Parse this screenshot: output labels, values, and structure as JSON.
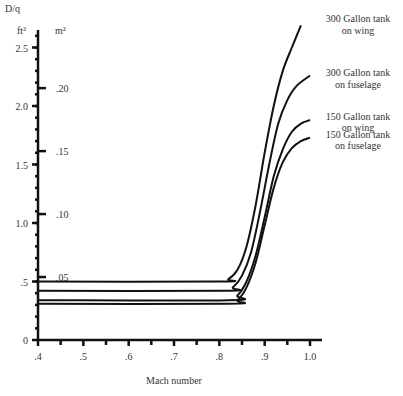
{
  "chart_data": {
    "type": "line",
    "title": "",
    "ylabel": "D/q",
    "ylabel_units_primary": "ft²",
    "ylabel_units_secondary": "m²",
    "xlabel": "Mach number",
    "xlim": [
      0.4,
      1.0
    ],
    "ylim": [
      0,
      2.7
    ],
    "x_ticks": [
      ".4",
      ".5",
      ".6",
      ".7",
      ".8",
      ".9",
      "1.0"
    ],
    "x_tick_values": [
      0.4,
      0.5,
      0.6,
      0.7,
      0.8,
      0.9,
      1.0
    ],
    "y_ticks_ft2": [
      "0",
      ".5",
      "1.0",
      "1.5",
      "2.0",
      "2.5"
    ],
    "y_tick_values_ft2": [
      0,
      0.5,
      1.0,
      1.5,
      2.0,
      2.5
    ],
    "y_ticks_m2": [
      ".05",
      ".10",
      ".15",
      ".20"
    ],
    "y_tick_values_m2": [
      0.05,
      0.1,
      0.15,
      0.2
    ],
    "grid": false,
    "legend_position": "inline-right",
    "series": [
      {
        "name": "300 Gallon tank on wing",
        "label_lines": [
          "300 Gallon tank",
          "on wing"
        ],
        "x": [
          0.4,
          0.8,
          0.82,
          0.84,
          0.86,
          0.88,
          0.9,
          0.92,
          0.94,
          0.96,
          0.98
        ],
        "values": [
          0.5,
          0.5,
          0.52,
          0.6,
          0.8,
          1.15,
          1.6,
          2.0,
          2.3,
          2.5,
          2.69
        ]
      },
      {
        "name": "300 Gallon tank on fuselage",
        "label_lines": [
          "300 Gallon tank",
          "on fuselage"
        ],
        "x": [
          0.4,
          0.81,
          0.83,
          0.85,
          0.87,
          0.89,
          0.91,
          0.93,
          0.95,
          0.97,
          1.0
        ],
        "values": [
          0.42,
          0.42,
          0.45,
          0.55,
          0.75,
          1.1,
          1.5,
          1.85,
          2.05,
          2.17,
          2.26
        ]
      },
      {
        "name": "150 Gallon tank on wing",
        "label_lines": [
          "150 Gallon tank",
          "on wing"
        ],
        "x": [
          0.4,
          0.82,
          0.84,
          0.86,
          0.88,
          0.9,
          0.92,
          0.94,
          0.96,
          0.98,
          1.0
        ],
        "values": [
          0.34,
          0.34,
          0.38,
          0.5,
          0.72,
          1.05,
          1.4,
          1.63,
          1.78,
          1.85,
          1.88
        ]
      },
      {
        "name": "150 Gallon tank on fuselage",
        "label_lines": [
          "150 Gallon tank",
          "on fuselage"
        ],
        "x": [
          0.4,
          0.82,
          0.84,
          0.86,
          0.88,
          0.9,
          0.92,
          0.94,
          0.96,
          0.98,
          1.0
        ],
        "values": [
          0.31,
          0.31,
          0.34,
          0.45,
          0.66,
          0.98,
          1.3,
          1.52,
          1.64,
          1.7,
          1.73
        ]
      }
    ]
  },
  "colors": {
    "line": "#111111",
    "text": "#333333",
    "background": "#ffffff"
  }
}
